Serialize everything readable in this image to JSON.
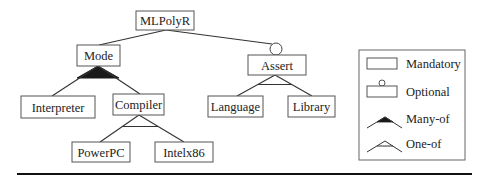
{
  "diagram": {
    "type": "feature-model",
    "nodes": {
      "root": {
        "label": "MLPolyR"
      },
      "mode": {
        "label": "Mode"
      },
      "assert": {
        "label": "Assert"
      },
      "interpreter": {
        "label": "Interpreter"
      },
      "compiler": {
        "label": "Compiler"
      },
      "language": {
        "label": "Language"
      },
      "library": {
        "label": "Library"
      },
      "powerpc": {
        "label": "PowerPC"
      },
      "intelx86": {
        "label": "Intelx86"
      }
    },
    "edges": [
      {
        "from": "MLPolyR",
        "to": "Mode",
        "kind": "mandatory"
      },
      {
        "from": "MLPolyR",
        "to": "Assert",
        "kind": "optional"
      },
      {
        "from": "Mode",
        "to": [
          "Interpreter",
          "Compiler"
        ],
        "kind": "many-of"
      },
      {
        "from": "Assert",
        "to": [
          "Language",
          "Library"
        ],
        "kind": "one-of"
      },
      {
        "from": "Compiler",
        "to": [
          "PowerPC",
          "Intelx86"
        ],
        "kind": "one-of"
      }
    ]
  },
  "legend": {
    "items": [
      {
        "label": "Mandatory",
        "symbol": "rectangle"
      },
      {
        "label": "Optional",
        "symbol": "rectangle-with-circle"
      },
      {
        "label": "Many-of",
        "symbol": "filled-arc"
      },
      {
        "label": "One-of",
        "symbol": "hollow-arc"
      }
    ]
  },
  "colors": {
    "stroke": "#555555",
    "text": "#222222",
    "fill_many_of": "#1a1a1a",
    "rule": "#111111"
  }
}
